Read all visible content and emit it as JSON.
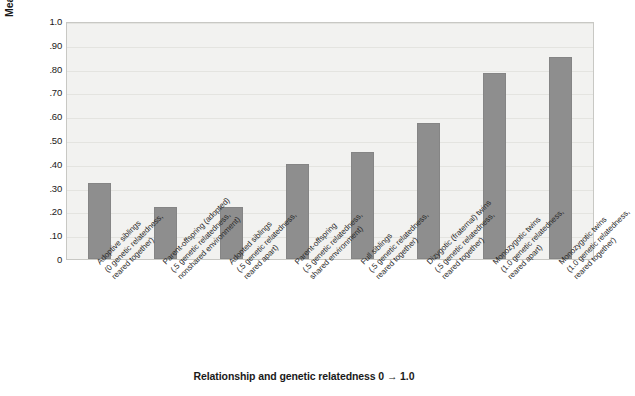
{
  "chart_data": {
    "type": "bar",
    "title": "",
    "xlabel": "Relationship and genetic relatedness 0 → 1.0",
    "ylabel": "Mean correlation in intelligence",
    "ylim": [
      0,
      1.0
    ],
    "grid": true,
    "legend": "none",
    "bar_color": "#8e8e8e",
    "plot_background": "#f2f2f0",
    "ytick_labels": [
      "1.0",
      ".90",
      ".80",
      ".70",
      ".60",
      ".50",
      ".40",
      ".30",
      ".20",
      ".10",
      "0"
    ],
    "ytick_values": [
      1.0,
      0.9,
      0.8,
      0.7,
      0.6,
      0.5,
      0.4,
      0.3,
      0.2,
      0.1,
      0
    ],
    "categories": [
      "Adoptive siblings (0 genetic relatedness, reared together)",
      "Parent-offspring (adopted) (.5 genetic relatedness, nonshared environment)",
      "Adopted siblings (.5 genetic relatedness, reared apart)",
      "Parent-offspring (.5 genetic relatedness, shared environment)",
      "Full siblings (.5 genetic relatedness, reared together)",
      "Dizygotic (fraternal) twins (.5 genetic relatedness, reared together)",
      "Monozygotic twins (1.0 genetic relatedness, reared apart)",
      "Monozygotic twins (1.0 genetic relatedness, reared together)"
    ],
    "category_lines": [
      [
        "Adoptive siblings",
        "(0 genetic relatedness,",
        "reared together)"
      ],
      [
        "Parent-offspring (adopted)",
        "(.5 genetic relatedness,",
        "nonshared environment)"
      ],
      [
        "Adopted siblings",
        "(.5 genetic relatedness,",
        "reared apart)"
      ],
      [
        "Parent-offspring",
        "(.5 genetic relatedness,",
        "shared environment)"
      ],
      [
        "Full siblings",
        "(.5 genetic relatedness,",
        "reared together)"
      ],
      [
        "Dizygotic (fraternal) twins",
        "(.5 genetic relatedness,",
        "reared together)"
      ],
      [
        "Monozygotic twins",
        "(1.0 genetic relatedness,",
        "reared apart)"
      ],
      [
        "Monozygotic twins",
        "(1.0 genetic relatedness,",
        "reared together)"
      ]
    ],
    "values": [
      0.32,
      0.22,
      0.22,
      0.4,
      0.45,
      0.57,
      0.78,
      0.85
    ]
  }
}
